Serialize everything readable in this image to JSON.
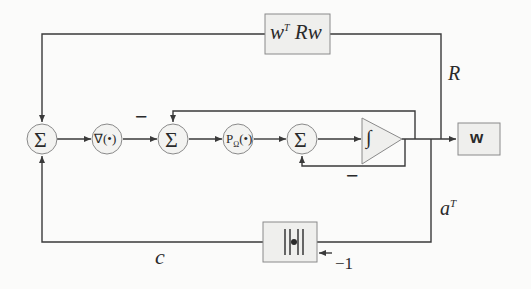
{
  "diagram": {
    "type": "block-diagram",
    "nodes": {
      "sum1": {
        "label": "Σ",
        "kind": "summing-junction"
      },
      "gradient": {
        "label": "∇(•)",
        "kind": "operator"
      },
      "sum2": {
        "label": "Σ",
        "kind": "summing-junction"
      },
      "projection": {
        "label": "P",
        "sub": "Ω",
        "suffix": "(•)",
        "kind": "operator"
      },
      "sum3": {
        "label": "Σ",
        "kind": "summing-junction"
      },
      "integrator": {
        "label": "∫",
        "kind": "integrator"
      },
      "quadratic_box": {
        "label_base": "w",
        "label_sup": "T",
        "label_rest": " Rw",
        "kind": "block"
      },
      "output_box": {
        "label": "w",
        "kind": "output"
      },
      "norm_box": {
        "label": "||•||",
        "kind": "block"
      }
    },
    "edge_labels": {
      "R": "R",
      "aT_base": "a",
      "aT_sup": "T",
      "c": "c",
      "minus_one": "−1",
      "minus_sign_1": "−",
      "minus_sign_2": "−"
    },
    "colors": {
      "line": "#3a3a3a",
      "box_fill": "#efefed",
      "box_stroke": "#8a8a8a",
      "node_fill": "#f3f3f1",
      "background": "#fbfbfa"
    }
  }
}
